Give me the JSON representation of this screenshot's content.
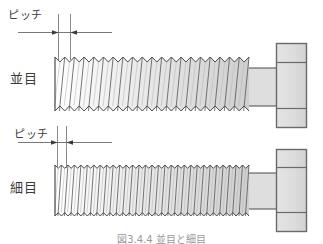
{
  "figure": {
    "title": "",
    "caption": "図3.4.4  並目と細目",
    "labels": {
      "pitch_top": "ピッチ",
      "pitch_bottom": "ピッチ",
      "coarse": "並目",
      "fine": "細目"
    },
    "colors": {
      "outline": "#4a4a4a",
      "fill": "#d9d9d9",
      "fill_light": "#e6e6e6",
      "dimension_line": "#5a5a5a",
      "text": "#3a3a3a",
      "background": "#ffffff"
    },
    "bolts": [
      {
        "name": "coarse-thread-bolt",
        "label": "並目",
        "thread_count": 20,
        "pitch_px": 9.7,
        "thread_x_start": 55,
        "thread_x_end": 249,
        "thread_y_top": 57,
        "thread_y_bottom": 111,
        "shank_x_start": 249,
        "shank_x_end": 277,
        "head_x": 276,
        "head_y": 43,
        "head_w": 31,
        "head_h": 85,
        "head_chamfer_top": 62,
        "head_chamfer_bottom": 108
      },
      {
        "name": "fine-thread-bolt",
        "label": "細目",
        "thread_count": 30,
        "pitch_px": 6.5,
        "thread_x_start": 55,
        "thread_x_end": 249,
        "thread_y_top": 165,
        "thread_y_bottom": 216,
        "shank_x_start": 249,
        "shank_x_end": 277,
        "head_x": 276,
        "head_y": 149,
        "head_w": 31,
        "head_h": 83,
        "head_chamfer_top": 167,
        "head_chamfer_bottom": 212
      }
    ],
    "dimensions": [
      {
        "name": "pitch-dimension-coarse",
        "label": "ピッチ",
        "line_y": 32,
        "line_x_start": 18,
        "line_x_end": 112,
        "arrow_left_x": 58,
        "arrow_right_x": 70,
        "ext_line_1_x": 58,
        "ext_line_2_x": 70,
        "ext_y_top": 14,
        "ext_y_bottom": 60
      },
      {
        "name": "pitch-dimension-fine",
        "label": "ピッチ",
        "line_y": 142,
        "line_x_start": 18,
        "line_x_end": 112,
        "arrow_left_x": 57,
        "arrow_right_x": 66,
        "ext_line_1_x": 57,
        "ext_line_2_x": 66,
        "ext_y_top": 126,
        "ext_y_bottom": 168
      }
    ]
  }
}
